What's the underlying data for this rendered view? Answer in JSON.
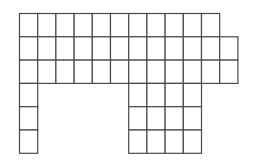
{
  "diagram": {
    "type": "grid-shape",
    "line_color": "#4a4a4a",
    "background": "#ffffff",
    "origin_x": 19.5,
    "origin_y": 13.5,
    "cell_width": 18.2,
    "cell_height": 23.3,
    "rows": [
      {
        "row": 0,
        "cols": [
          0,
          1,
          2,
          3,
          4,
          5,
          6,
          7,
          8,
          9,
          10
        ]
      },
      {
        "row": 1,
        "cols": [
          0,
          1,
          2,
          3,
          4,
          5,
          6,
          7,
          8,
          9,
          10,
          11
        ]
      },
      {
        "row": 2,
        "cols": [
          0,
          1,
          2,
          3,
          4,
          5,
          6,
          7,
          8,
          9,
          10,
          11
        ]
      },
      {
        "row": 3,
        "cols": [
          0,
          6,
          7,
          8,
          9
        ]
      },
      {
        "row": 4,
        "cols": [
          0,
          6,
          7,
          8,
          9
        ]
      },
      {
        "row": 5,
        "cols": [
          0,
          6,
          7,
          8,
          9
        ]
      }
    ]
  }
}
